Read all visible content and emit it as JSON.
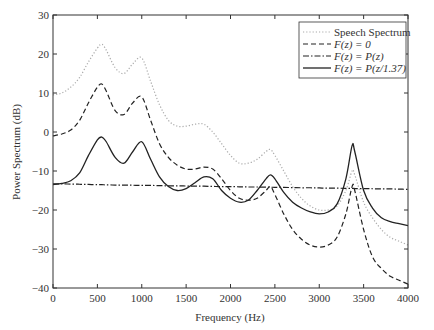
{
  "chart_data": {
    "type": "line",
    "title": "",
    "xlabel": "Frequency (Hz)",
    "ylabel": "Power Spectrum (dB)",
    "xlim": [
      0,
      4000
    ],
    "ylim": [
      -40,
      30
    ],
    "xticks": [
      0,
      500,
      1000,
      1500,
      2000,
      2500,
      3000,
      3500,
      4000
    ],
    "yticks": [
      -40,
      -30,
      -20,
      -10,
      0,
      10,
      20,
      30
    ],
    "grid": false,
    "legend_position": "upper right",
    "x": [
      0,
      100,
      200,
      300,
      400,
      500,
      550,
      600,
      700,
      800,
      900,
      1000,
      1100,
      1200,
      1300,
      1400,
      1500,
      1600,
      1700,
      1800,
      1900,
      2000,
      2100,
      2200,
      2300,
      2400,
      2450,
      2500,
      2600,
      2700,
      2800,
      2900,
      3000,
      3100,
      3200,
      3300,
      3370,
      3400,
      3500,
      3600,
      3700,
      3800,
      3900,
      4000
    ],
    "series": [
      {
        "name": "Speech Spectrum",
        "style": "dotted",
        "color": "#aaaaaa",
        "values": [
          9.5,
          10,
          11.5,
          14,
          18,
          21.5,
          22.5,
          21,
          16.5,
          15,
          17.5,
          19,
          13,
          7,
          3,
          1.5,
          1.5,
          2,
          2,
          0,
          -3,
          -6,
          -8,
          -8,
          -7,
          -5,
          -4.5,
          -6,
          -10,
          -14,
          -17,
          -19,
          -20,
          -20,
          -19,
          -15,
          -10,
          -11,
          -18,
          -22,
          -25,
          -27,
          -28,
          -29
        ]
      },
      {
        "name": "F(z) = 0",
        "style": "dashed",
        "color": "#222222",
        "values": [
          -1,
          -0.5,
          0.5,
          3,
          7.5,
          11.5,
          12.3,
          10.5,
          5.5,
          4.5,
          7.5,
          9,
          3,
          -3,
          -6.5,
          -8.5,
          -9.5,
          -9.5,
          -9,
          -9.5,
          -12,
          -15,
          -17,
          -17.5,
          -17,
          -15,
          -14,
          -16,
          -21,
          -25,
          -27.5,
          -29,
          -29.5,
          -29,
          -27,
          -21,
          -14,
          -15,
          -25,
          -32,
          -35,
          -37,
          -38,
          -39
        ]
      },
      {
        "name": "F(z) = P(z)",
        "style": "dashdot",
        "color": "#222222",
        "values": [
          -13.3,
          -13.3,
          -13.35,
          -13.4,
          -13.45,
          -13.5,
          -13.5,
          -13.55,
          -13.6,
          -13.6,
          -13.65,
          -13.7,
          -13.7,
          -13.75,
          -13.8,
          -13.8,
          -13.85,
          -13.9,
          -13.9,
          -13.95,
          -14,
          -14,
          -14.05,
          -14.1,
          -14.1,
          -14.15,
          -14.15,
          -14.2,
          -14.2,
          -14.25,
          -14.3,
          -14.3,
          -14.35,
          -14.4,
          -14.4,
          -14.45,
          -14.45,
          -14.5,
          -14.5,
          -14.55,
          -14.6,
          -14.6,
          -14.65,
          -14.7
        ]
      },
      {
        "name": "F(z) = P(z/1.37)",
        "style": "solid",
        "color": "#222222",
        "values": [
          -13.5,
          -13.2,
          -12.5,
          -10.5,
          -6,
          -2,
          -1.3,
          -2.5,
          -6.5,
          -8,
          -5,
          -2.5,
          -7,
          -11.5,
          -14,
          -15,
          -14.5,
          -13,
          -11.5,
          -12,
          -15,
          -17,
          -18,
          -17.5,
          -15,
          -12,
          -11,
          -12,
          -15.5,
          -18,
          -19.5,
          -20.5,
          -21,
          -20.5,
          -18.5,
          -12,
          -3.5,
          -5,
          -15,
          -19.5,
          -22,
          -23,
          -23.5,
          -24
        ]
      }
    ]
  },
  "legend": {
    "items": [
      {
        "label": "Speech Spectrum"
      },
      {
        "label": "F(z) = 0"
      },
      {
        "label": "F(z) = P(z)"
      },
      {
        "label": "F(z) = P(z/1.37)"
      }
    ]
  }
}
